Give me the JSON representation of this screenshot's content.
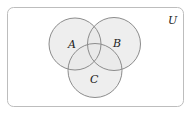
{
  "diagram": {
    "type": "venn",
    "universe": {
      "label": "U"
    },
    "sets": [
      {
        "label": "A"
      },
      {
        "label": "B"
      },
      {
        "label": "C"
      }
    ],
    "colors": {
      "fill": "#e8e8e8",
      "stroke": "#8c8c8c",
      "frame": "#bdbdbd",
      "background": "#ffffff",
      "text": "#222222"
    }
  }
}
